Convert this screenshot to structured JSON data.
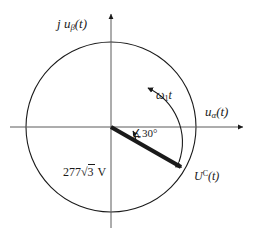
{
  "figure": {
    "kind": "phasor-diagram",
    "stroke_color": "#1a1a1a",
    "background_color": "#ffffff",
    "thin_line_width": 1,
    "phasor_line_width": 4
  },
  "axes": {
    "vertical_label": "j uβ(t)",
    "vertical_label_parts": {
      "j": "j",
      "u": "u",
      "subscript": "β",
      "arg": "(t)"
    },
    "horizontal_label": "uα(t)",
    "horizontal_label_parts": {
      "u": "u",
      "subscript": "α",
      "arg": "(t)"
    },
    "origin_x": 111,
    "origin_y": 127
  },
  "circle": {
    "center_x": 111,
    "center_y": 127,
    "radius": 85,
    "label": "locus circle"
  },
  "phasor": {
    "label": "UC(t)",
    "label_parts": {
      "symbol": "U",
      "superscript": "C",
      "arg": "(t)"
    },
    "magnitude_label": "277√3 V",
    "magnitude_parts": {
      "coefficient": "277",
      "radical": "√",
      "radicand": "3",
      "unit": "V"
    },
    "angle_deg": -30,
    "angle_label": "∠30°",
    "angle_value": "30°",
    "tip_x": 185,
    "tip_y": 169
  },
  "rotation": {
    "label": "ω1t",
    "label_parts": {
      "omega": "ω",
      "subscript": "1",
      "time": "t"
    },
    "direction": "counterclockwise"
  }
}
